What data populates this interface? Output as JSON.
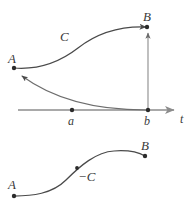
{
  "figure": {
    "stroke_color": "#4a4a4a",
    "axis_color": "#8c8c8c",
    "point_color": "#2b2b2b",
    "label_color": "#3a3a3a",
    "width": 195,
    "height": 211
  },
  "top_diagram": {
    "curve_label": "C",
    "start_point_label": "A",
    "end_point_label": "B",
    "axis_label": "t",
    "tick_a_label": "a",
    "tick_b_label": "b",
    "points": {
      "A": {
        "x": 14,
        "y": 68
      },
      "B": {
        "x": 147,
        "y": 27
      },
      "a": {
        "x": 72,
        "y": 110
      },
      "b": {
        "x": 148,
        "y": 110
      }
    },
    "curve_path": "M14,68 C40,70 60,62 78,48 C96,34 118,26 146,27",
    "arc_path": "M146,110 C110,110 60,104 22,76",
    "vertical_path": "M148,109 L148,33",
    "axis_path": "M18,110 L174,110"
  },
  "bottom_diagram": {
    "curve_label": "−C",
    "start_point_label": "A",
    "end_point_label": "B",
    "points": {
      "A": {
        "x": 14,
        "y": 196
      },
      "B": {
        "x": 145,
        "y": 156
      },
      "mid": {
        "x": 77,
        "y": 168
      }
    },
    "curve_path": "M14,196 C32,196 52,194 66,180 C80,166 96,152 114,151 C128,150 138,152 145,156"
  },
  "labels": {
    "top_A": {
      "text": "A",
      "x": 8,
      "y": 52
    },
    "top_B": {
      "text": "B",
      "x": 143,
      "y": 10
    },
    "top_C": {
      "text": "C",
      "x": 60,
      "y": 30
    },
    "axis_a": {
      "text": "a",
      "x": 68,
      "y": 115
    },
    "axis_b": {
      "text": "b",
      "x": 144,
      "y": 115
    },
    "axis_t": {
      "text": "t",
      "x": 180,
      "y": 113
    },
    "bottom_A": {
      "text": "A",
      "x": 8,
      "y": 178
    },
    "bottom_B": {
      "text": "B",
      "x": 141,
      "y": 139
    },
    "bottom_C": {
      "text": "−C",
      "x": 78,
      "y": 170
    }
  }
}
